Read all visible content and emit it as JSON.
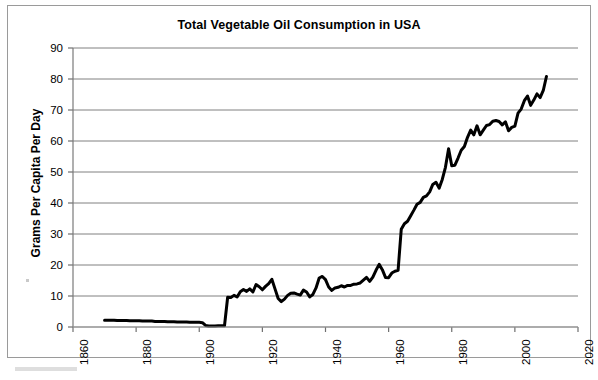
{
  "figure": {
    "title": "Total Vegetable Oil Consumption in USA",
    "frame_color": "#9a9a9a",
    "background": "#ffffff"
  },
  "chart_data": {
    "type": "line",
    "title": "Total Vegetable Oil Consumption in USA",
    "xlabel": "",
    "ylabel": "Grams Per Capita Per Day",
    "xlim": [
      1860,
      2020
    ],
    "ylim": [
      0,
      90
    ],
    "xticks": [
      1860,
      1880,
      1900,
      1920,
      1940,
      1960,
      1980,
      2000,
      2020
    ],
    "yticks": [
      0,
      10,
      20,
      30,
      40,
      50,
      60,
      70,
      80,
      90
    ],
    "xtick_labels": [
      "1860",
      "1880",
      "1900",
      "1920",
      "1940",
      "1960",
      "1980",
      "2000",
      "2020"
    ],
    "ytick_labels": [
      "0",
      "10",
      "20",
      "30",
      "40",
      "50",
      "60",
      "70",
      "80",
      "90"
    ],
    "grid": "horizontal",
    "grid_color": "#808080",
    "legend": null,
    "line_color": "#000000",
    "line_width": 3,
    "series": [
      {
        "name": "Total vegetable oil consumption",
        "x": [
          1870,
          1871,
          1872,
          1873,
          1874,
          1875,
          1876,
          1877,
          1878,
          1879,
          1880,
          1881,
          1882,
          1883,
          1884,
          1885,
          1886,
          1887,
          1888,
          1889,
          1890,
          1891,
          1892,
          1893,
          1894,
          1895,
          1896,
          1897,
          1898,
          1899,
          1900,
          1901,
          1902,
          1903,
          1904,
          1905,
          1906,
          1907,
          1908,
          1909,
          1910,
          1911,
          1912,
          1913,
          1914,
          1915,
          1916,
          1917,
          1918,
          1919,
          1920,
          1921,
          1922,
          1923,
          1924,
          1925,
          1926,
          1927,
          1928,
          1929,
          1930,
          1931,
          1932,
          1933,
          1934,
          1935,
          1936,
          1937,
          1938,
          1939,
          1940,
          1941,
          1942,
          1943,
          1944,
          1945,
          1946,
          1947,
          1948,
          1949,
          1950,
          1951,
          1952,
          1953,
          1954,
          1955,
          1956,
          1957,
          1958,
          1959,
          1960,
          1961,
          1962,
          1963,
          1964,
          1965,
          1966,
          1967,
          1968,
          1969,
          1970,
          1971,
          1972,
          1973,
          1974,
          1975,
          1976,
          1977,
          1978,
          1979,
          1980,
          1981,
          1982,
          1983,
          1984,
          1985,
          1986,
          1987,
          1988,
          1989,
          1990,
          1991,
          1992,
          1993,
          1994,
          1995,
          1996,
          1997,
          1998,
          1999,
          2000,
          2001,
          2002,
          2003,
          2004,
          2005,
          2006,
          2007,
          2008,
          2009,
          2010
        ],
        "values": [
          2.2,
          2.2,
          2.2,
          2.2,
          2.1,
          2.1,
          2.1,
          2.1,
          2.0,
          2.0,
          2.0,
          2.0,
          1.9,
          1.9,
          1.9,
          1.9,
          1.8,
          1.8,
          1.8,
          1.8,
          1.7,
          1.7,
          1.7,
          1.6,
          1.6,
          1.6,
          1.6,
          1.5,
          1.5,
          1.5,
          1.5,
          1.4,
          0.5,
          0.3,
          0.3,
          0.3,
          0.4,
          0.4,
          0.4,
          9.6,
          9.5,
          10.2,
          9.7,
          11.4,
          12.1,
          11.5,
          12.3,
          11.3,
          13.7,
          13.0,
          12.0,
          13.1,
          14.0,
          15.4,
          12.3,
          9.2,
          8.2,
          9.0,
          10.2,
          10.9,
          11.0,
          10.6,
          10.3,
          11.9,
          11.3,
          9.7,
          10.5,
          12.6,
          15.8,
          16.3,
          15.3,
          12.9,
          11.8,
          12.6,
          12.8,
          13.3,
          12.9,
          13.4,
          13.4,
          13.8,
          13.9,
          14.2,
          15.1,
          16.0,
          14.7,
          16.1,
          18.3,
          20.2,
          18.5,
          16.0,
          15.9,
          17.4,
          18.0,
          18.3,
          31.5,
          33.3,
          34.1,
          35.9,
          37.7,
          39.6,
          40.2,
          41.8,
          42.3,
          43.6,
          46.0,
          46.7,
          44.8,
          47.6,
          51.5,
          57.5,
          52.0,
          52.2,
          54.5,
          57.0,
          58.2,
          61.2,
          63.5,
          62.0,
          64.9,
          62.0,
          63.5,
          65.0,
          65.3,
          66.4,
          66.6,
          66.3,
          65.2,
          66.2,
          63.3,
          64.4,
          64.8,
          69.0,
          70.3,
          73.0,
          74.5,
          71.5,
          73.2,
          75.2,
          74.0,
          76.3,
          80.8
        ]
      }
    ]
  },
  "axes": {
    "ylabel_text": "Grams Per Capita Per Day"
  }
}
